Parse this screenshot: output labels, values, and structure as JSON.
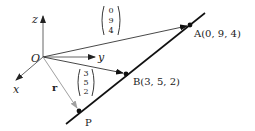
{
  "diagram": {
    "type": "3d-vector-line",
    "origin": {
      "label": "O",
      "x": 43,
      "y": 57
    },
    "axes": {
      "z": {
        "label": "z",
        "tip": [
          43,
          15
        ],
        "label_pos": [
          32,
          23
        ]
      },
      "y": {
        "label": "y",
        "tip": [
          96,
          57
        ],
        "label_pos": [
          98,
          61
        ]
      },
      "x": {
        "label": "x",
        "tip": [
          15,
          81
        ],
        "label_pos": [
          13,
          93
        ]
      }
    },
    "points": {
      "A": {
        "label": "A(0, 9, 4)",
        "x": 190,
        "y": 25,
        "label_pos": [
          194,
          37
        ]
      },
      "B": {
        "label": "B(3, 5, 2)",
        "x": 126,
        "y": 74,
        "label_pos": [
          133,
          85
        ]
      },
      "P": {
        "label": "P",
        "x": 79,
        "y": 111,
        "label_pos": [
          85,
          126
        ]
      }
    },
    "line": {
      "from": [
        66,
        124
      ],
      "to": [
        205,
        13
      ]
    },
    "vectors": {
      "OA": {
        "components": [
          "0",
          "9",
          "4"
        ],
        "bracket_pos": [
          100,
          5
        ]
      },
      "OB": {
        "components": [
          "3",
          "5",
          "2"
        ],
        "bracket_pos": [
          75,
          68
        ]
      },
      "r": {
        "label": "r",
        "label_pos": [
          52,
          91
        ],
        "color": "#9a9a9a"
      }
    },
    "colors": {
      "ink": "#111111",
      "axis": "#555555",
      "r_vector": "#a0a0a0"
    }
  }
}
